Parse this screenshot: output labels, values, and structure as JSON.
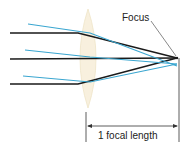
{
  "diagram": {
    "labels": {
      "focus": "Focus",
      "focal_length": "1 focal length"
    },
    "colors": {
      "black_ray": "#1a1a1a",
      "blue_ray": "#3aa6d0",
      "lens_fill": "#f7efdc",
      "lens_edge": "#efe3c6",
      "dimension_line": "#333333"
    },
    "elements": {
      "lens": "convex-lens",
      "rays": [
        "black-ray-top",
        "black-ray-middle",
        "black-ray-bottom",
        "blue-ray-top",
        "blue-ray-middle",
        "blue-ray-bottom"
      ],
      "focal_point": "focus-point",
      "dimension": "focal-length-dimension"
    }
  }
}
